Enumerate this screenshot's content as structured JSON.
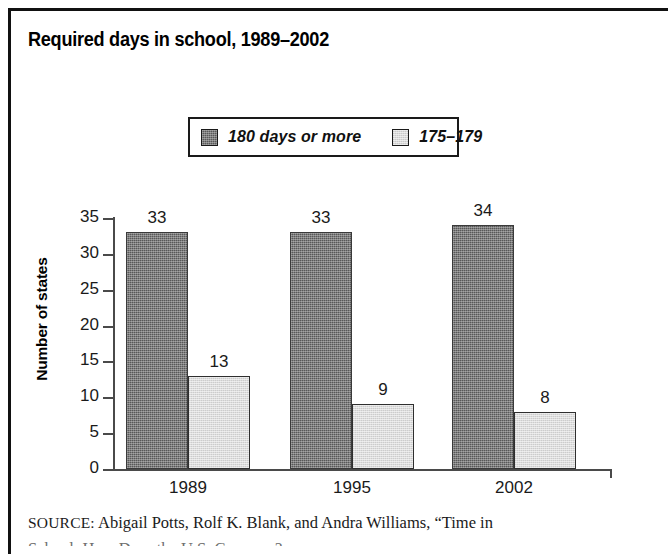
{
  "figure": {
    "title": "Required days in school, 1989–2002",
    "source_label": "SOURCE:",
    "source_text": "Abigail Potts, Rolf K. Blank, and Andra Williams, “Time in",
    "source_text_continued": "School: How Does the U.S. Compare?"
  },
  "chart_data": {
    "type": "bar",
    "title": "Required days in school, 1989–2002",
    "xlabel": "",
    "ylabel": "Number of states",
    "categories": [
      "1989",
      "1995",
      "2002"
    ],
    "series": [
      {
        "name": "180 days or more",
        "color": "#585858",
        "values": [
          33,
          33,
          34
        ]
      },
      {
        "name": "175–179",
        "color": "#dcdcdc",
        "values": [
          13,
          9,
          8
        ]
      }
    ],
    "ylim": [
      0,
      35
    ],
    "ytick_values": [
      0,
      5,
      10,
      15,
      20,
      25,
      30,
      35
    ],
    "ytick_labels": [
      "0",
      "5",
      "10",
      "15",
      "20",
      "25",
      "30",
      "35"
    ],
    "grid": false,
    "legend_position": "top-center",
    "data_labels": true
  },
  "legend": {
    "entries": [
      {
        "label": "180 days or more",
        "swatch": "dark-hatch-swatch"
      },
      {
        "label": "175–179",
        "swatch": "light-hatch-swatch"
      }
    ]
  }
}
